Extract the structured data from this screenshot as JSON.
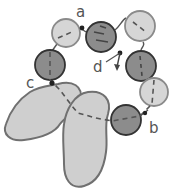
{
  "diagram": {
    "colors": {
      "light_fill": "#d6d6d6",
      "dark_fill": "#8c8c8c",
      "light_stroke": "#8a8a8a",
      "dark_stroke": "#333333",
      "blob_fill": "#cfcfcf",
      "blob_stroke": "#707070",
      "dash": "#555555",
      "dot": "#222222"
    },
    "labels": {
      "a": "a",
      "b": "b",
      "c": "c",
      "d": "d"
    },
    "beads": [
      {
        "id": "bead-light-top-left",
        "shade": "light"
      },
      {
        "id": "bead-dark-top-middle",
        "shade": "dark"
      },
      {
        "id": "bead-light-top-right",
        "shade": "light"
      },
      {
        "id": "bead-dark-left",
        "shade": "dark"
      },
      {
        "id": "bead-dark-right",
        "shade": "dark"
      },
      {
        "id": "bead-light-right-lower",
        "shade": "light"
      },
      {
        "id": "bead-dark-bottom",
        "shade": "dark"
      }
    ],
    "blobs": [
      {
        "id": "blob-left"
      },
      {
        "id": "blob-right"
      }
    ]
  }
}
